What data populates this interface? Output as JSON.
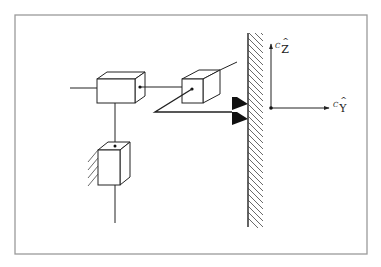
{
  "diagram": {
    "type": "mechanism-schematic",
    "colors": {
      "background": "#ffffff",
      "frame_border": "#9a9a9a",
      "stroke": "#222222",
      "fill_triangles": "#111111",
      "hatch": "#444444"
    },
    "frame": {
      "x": 15,
      "y": 15,
      "width": 352,
      "height": 239
    },
    "components": [
      {
        "id": "block-1",
        "kind": "cuboid-joint",
        "front": [
          97,
          79,
          38,
          24
        ],
        "depth": [
          10,
          -7
        ]
      },
      {
        "id": "block-2",
        "kind": "cuboid-joint",
        "front": [
          182,
          79,
          21,
          24
        ],
        "depth": [
          17,
          -9
        ]
      },
      {
        "id": "block-3",
        "kind": "cuboid-joint-grounded",
        "front": [
          98,
          150,
          22,
          35
        ],
        "depth": [
          10,
          -8
        ]
      }
    ],
    "wall": {
      "x": 248,
      "y_top": 33,
      "y_bottom": 227,
      "hatch_width": 14
    },
    "contact_triangles": 2,
    "axes": {
      "origin": [
        271,
        108
      ],
      "z_axis": {
        "label_superscript": "C",
        "label": "Z",
        "hat": true
      },
      "y_axis": {
        "label_superscript": "C",
        "label": "Y",
        "hat": true
      }
    }
  }
}
